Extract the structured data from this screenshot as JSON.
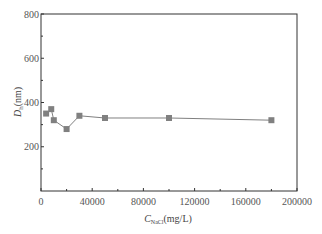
{
  "chart_data": {
    "type": "line",
    "title": "",
    "xlabel": "C_NaCl(mg/L)",
    "xlabel_main": "C",
    "xlabel_sub": "NaCl",
    "xlabel_unit": "(mg/L)",
    "ylabel": "D_h(nm)",
    "ylabel_main": "D",
    "ylabel_sub": "h",
    "ylabel_unit": "(nm)",
    "xlim": [
      0,
      200000
    ],
    "ylim": [
      0,
      800
    ],
    "xticks": [
      "0",
      "40000",
      "80000",
      "120000",
      "160000",
      "200000"
    ],
    "yticks": [
      "200",
      "400",
      "600",
      "800"
    ],
    "grid": false,
    "legend": null,
    "series": [
      {
        "name": "D_h",
        "marker": "square",
        "color": "#808080",
        "x": [
          4000,
          8000,
          10000,
          20000,
          30000,
          50000,
          100000,
          180000
        ],
        "y": [
          350,
          370,
          320,
          280,
          340,
          330,
          330,
          320
        ]
      }
    ]
  },
  "colors": {
    "axis": "#333333",
    "series": "#808080",
    "tick_text": "#555555"
  }
}
